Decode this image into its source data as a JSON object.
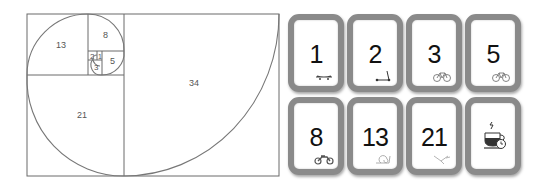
{
  "spiral": {
    "squares": [
      {
        "label": "34",
        "x": 124,
        "y": 14,
        "size": 155
      },
      {
        "label": "21",
        "x": 27,
        "y": 75,
        "size": 97
      },
      {
        "label": "13",
        "x": 27,
        "y": 14,
        "size": 61
      },
      {
        "label": "8",
        "x": 88,
        "y": 14,
        "size": 36
      },
      {
        "label": "5",
        "x": 102,
        "y": 51,
        "size": 22
      },
      {
        "label": "3",
        "x": 88,
        "y": 60,
        "size": 14
      },
      {
        "label": "2",
        "x": 88,
        "y": 51,
        "size": 9
      },
      {
        "label": "1",
        "x": 97,
        "y": 51,
        "size": 5
      }
    ],
    "line_color": "#666666"
  },
  "cards": [
    {
      "value": "1",
      "icon": "skateboard-icon"
    },
    {
      "value": "2",
      "icon": "scooter-icon"
    },
    {
      "value": "3",
      "icon": "bicycle-icon"
    },
    {
      "value": "5",
      "icon": "bicycle-icon"
    },
    {
      "value": "8",
      "icon": "motorcycle-icon"
    },
    {
      "value": "13",
      "icon": "snail-icon"
    },
    {
      "value": "21",
      "icon": "bird-icon"
    },
    {
      "value": "",
      "icon": "coffee-break-icon"
    }
  ],
  "colors": {
    "card_border": "#8a8a8a",
    "card_bg": "#ffffff",
    "number": "#111111"
  }
}
